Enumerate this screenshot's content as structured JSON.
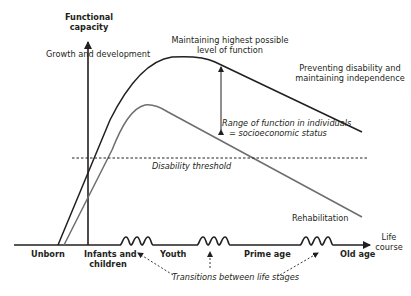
{
  "diagram": {
    "y_axis_label": [
      "Functional",
      "capacity"
    ],
    "x_axis_label": [
      "Life",
      "course"
    ],
    "annotations": {
      "growth": "Growth and development",
      "maintaining": [
        "Maintaining highest possible",
        "level of function"
      ],
      "preventing": [
        "Preventing disability and",
        "maintaining independence"
      ],
      "range": [
        "Range of function in individuals",
        "= socioeconomic status"
      ],
      "threshold": "Disability threshold",
      "rehabilitation": "Rehabilitation",
      "transitions": "Transitions between life stages"
    },
    "life_stages": [
      {
        "label": "Unborn"
      },
      {
        "label": [
          "Infants and",
          "children"
        ]
      },
      {
        "label": "Youth"
      },
      {
        "label": "Prime age"
      },
      {
        "label": "Old age"
      }
    ],
    "colors": {
      "upper_curve": "#231f20",
      "lower_curve": "#6d6e70",
      "axis": "#231f20"
    }
  }
}
